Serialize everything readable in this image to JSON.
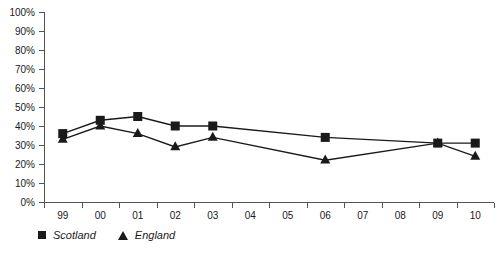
{
  "chart_data": {
    "type": "line",
    "title": "",
    "subtitle": "",
    "xlabel": "",
    "ylabel": "",
    "categories": [
      "99",
      "00",
      "01",
      "02",
      "03",
      "04",
      "05",
      "06",
      "07",
      "08",
      "09",
      "10"
    ],
    "ylim": [
      0,
      100
    ],
    "ytick_labels": [
      "0%",
      "10%",
      "20%",
      "30%",
      "40%",
      "50%",
      "60%",
      "70%",
      "80%",
      "90%",
      "100%"
    ],
    "ytick_values": [
      0,
      10,
      20,
      30,
      40,
      50,
      60,
      70,
      80,
      90,
      100
    ],
    "grid": false,
    "legend_position": "bottom-left",
    "series": [
      {
        "name": "Scotland",
        "marker": "square",
        "color": "#1a1a1a",
        "x": [
          "99",
          "00",
          "01",
          "02",
          "03",
          "06",
          "09",
          "10"
        ],
        "values": [
          36,
          43,
          45,
          40,
          40,
          34,
          31,
          31
        ]
      },
      {
        "name": "England",
        "marker": "triangle",
        "color": "#1a1a1a",
        "x": [
          "99",
          "00",
          "01",
          "02",
          "03",
          "06",
          "09",
          "10"
        ],
        "values": [
          33,
          40,
          36,
          29,
          34,
          22,
          31,
          24
        ]
      }
    ]
  },
  "legend": {
    "items": [
      {
        "label": "Scotland",
        "marker": "square"
      },
      {
        "label": "England",
        "marker": "triangle"
      }
    ]
  }
}
